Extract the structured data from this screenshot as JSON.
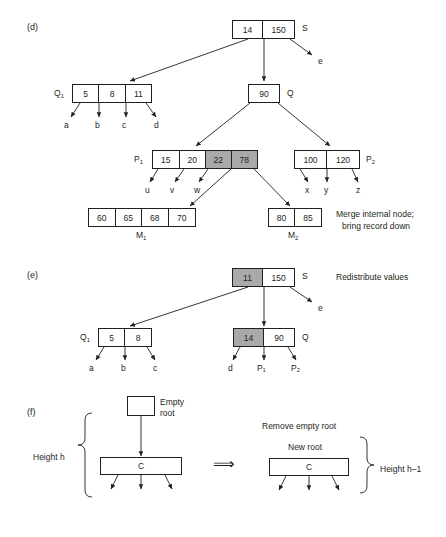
{
  "figure": {
    "sections": [
      {
        "id": "d",
        "label": "(d)"
      },
      {
        "id": "e",
        "label": "(e)"
      },
      {
        "id": "f",
        "label": "(f)"
      }
    ]
  },
  "panel_d": {
    "section_label": "(d)",
    "root": {
      "name": "S",
      "cells": [
        {
          "value": "14",
          "shaded": false
        },
        {
          "value": "150",
          "shaded": false
        }
      ]
    },
    "q1": {
      "name": "Q",
      "sub": "1",
      "cells": [
        {
          "value": "5",
          "shaded": false
        },
        {
          "value": "8",
          "shaded": false
        },
        {
          "value": "11",
          "shaded": false
        }
      ]
    },
    "q": {
      "name": "Q",
      "cells": [
        {
          "value": "90",
          "shaded": false
        }
      ]
    },
    "p1": {
      "name": "P",
      "sub": "1",
      "cells": [
        {
          "value": "15",
          "shaded": false
        },
        {
          "value": "20",
          "shaded": false
        },
        {
          "value": "22",
          "shaded": true
        },
        {
          "value": "78",
          "shaded": true
        }
      ]
    },
    "p2": {
      "name": "P",
      "sub": "2",
      "cells": [
        {
          "value": "100",
          "shaded": false
        },
        {
          "value": "120",
          "shaded": false
        }
      ]
    },
    "m1": {
      "name": "M",
      "sub": "1",
      "cells": [
        {
          "value": "60",
          "shaded": false
        },
        {
          "value": "65",
          "shaded": false
        },
        {
          "value": "68",
          "shaded": false
        },
        {
          "value": "70",
          "shaded": false
        }
      ]
    },
    "m2": {
      "name": "M",
      "sub": "2",
      "cells": [
        {
          "value": "80",
          "shaded": false
        },
        {
          "value": "85",
          "shaded": false
        }
      ]
    },
    "leaves": {
      "e": "e",
      "q1_children": [
        "a",
        "b",
        "c",
        "d"
      ],
      "p1_children": [
        "u",
        "v",
        "w"
      ],
      "p2_children": [
        "x",
        "y",
        "z"
      ]
    },
    "note_line1": "Merge internal node;",
    "note_line2": "bring record down"
  },
  "panel_e": {
    "section_label": "(e)",
    "root": {
      "name": "S",
      "cells": [
        {
          "value": "11",
          "shaded": true
        },
        {
          "value": "150",
          "shaded": false
        }
      ]
    },
    "q1": {
      "name": "Q",
      "sub": "1",
      "cells": [
        {
          "value": "5",
          "shaded": false
        },
        {
          "value": "8",
          "shaded": false
        }
      ]
    },
    "q": {
      "name": "Q",
      "cells": [
        {
          "value": "14",
          "shaded": true
        },
        {
          "value": "90",
          "shaded": false
        }
      ]
    },
    "note": "Redistribute values",
    "leaves": {
      "e": "e",
      "q1_children": [
        "a",
        "b",
        "c"
      ],
      "q_children": [
        "d",
        "P₁",
        "P₂"
      ]
    }
  },
  "panel_f": {
    "section_label": "(f)",
    "empty_root_label_line1": "Empty",
    "empty_root_label_line2": "root",
    "empty_root_value": "",
    "left_node_value": "C",
    "height_left_label": "Height h",
    "transform_note": "Remove empty root",
    "new_root_label": "New root",
    "right_node_value": "C",
    "height_right_label": "Height h–1",
    "implies_glyph": "⟹"
  },
  "colors": {
    "ink": "#231f20",
    "shade": "#a9a9a9",
    "background": "#ffffff"
  }
}
